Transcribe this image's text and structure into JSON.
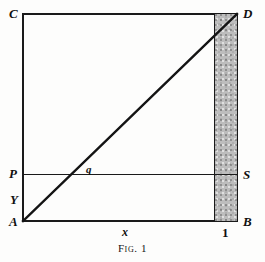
{
  "figure": {
    "caption_prefix": "Fig.",
    "caption_number": "1",
    "background_color": "#fdfdfc",
    "ink_color": "#1a1a1a",
    "shade_color": "#bdbdbd",
    "vertices": {
      "top_left": "C",
      "top_right": "D",
      "bottom_left": "A",
      "bottom_right": "B",
      "mid_left": "P",
      "mid_right": "S"
    },
    "annotations": {
      "origin_offset": "Y",
      "diagonal_point": "q",
      "axis_variable": "x",
      "axis_unit": "1"
    },
    "geometry": {
      "square_left": 22,
      "square_top": 13,
      "square_width": 216,
      "square_height": 209,
      "ps_line_y": 174,
      "band_left": 214,
      "band_right": 237,
      "diagonal_from": "A",
      "diagonal_to": "D"
    }
  }
}
